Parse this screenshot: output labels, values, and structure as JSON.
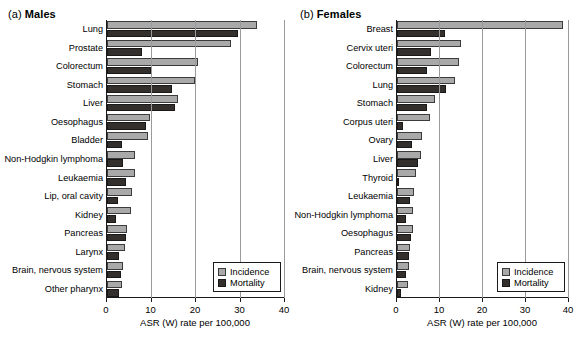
{
  "figure": {
    "axis_label": "ASR (W) rate per 100,000",
    "legend": {
      "incidence": "Incidence",
      "mortality": "Mortality"
    },
    "colors": {
      "incidence": "#a9a9a9",
      "mortality": "#332f2d",
      "axis": "#1a1a1a",
      "grid": "#9a9a9a"
    },
    "ticks": [
      "0",
      "10",
      "20",
      "30",
      "40"
    ]
  },
  "chart_data": [
    {
      "type": "bar",
      "orientation": "horizontal",
      "panel_tag": "(a)",
      "title": "Males",
      "xlabel": "ASR (W) rate per 100,000",
      "ylabel": "",
      "xlim": [
        0,
        40
      ],
      "xticks": [
        0,
        10,
        20,
        30,
        40
      ],
      "grid": true,
      "legend_position": "bottom-right",
      "categories": [
        "Lung",
        "Prostate",
        "Colorectum",
        "Stomach",
        "Liver",
        "Oesophagus",
        "Bladder",
        "Non-Hodgkin lymphoma",
        "Leukaemia",
        "Lip, oral cavity",
        "Kidney",
        "Pancreas",
        "Larynx",
        "Brain, nervous system",
        "Other pharynx"
      ],
      "series": [
        {
          "name": "Incidence",
          "values": [
            33.8,
            27.9,
            20.4,
            19.8,
            16.0,
            9.7,
            9.2,
            6.4,
            6.3,
            5.6,
            5.4,
            4.5,
            4.0,
            3.7,
            3.4
          ]
        },
        {
          "name": "Mortality",
          "values": [
            29.4,
            7.9,
            9.9,
            14.7,
            15.2,
            8.8,
            3.4,
            3.7,
            4.2,
            2.5,
            2.1,
            4.3,
            2.6,
            3.1,
            2.8
          ]
        }
      ]
    },
    {
      "type": "bar",
      "orientation": "horizontal",
      "panel_tag": "(b)",
      "title": "Females",
      "xlabel": "ASR (W) rate per 100,000",
      "ylabel": "",
      "xlim": [
        0,
        40
      ],
      "xticks": [
        0,
        10,
        20,
        30,
        40
      ],
      "grid": true,
      "legend_position": "bottom-right",
      "categories": [
        "Breast",
        "Cervix uteri",
        "Colorectum",
        "Lung",
        "Stomach",
        "Corpus uteri",
        "Ovary",
        "Liver",
        "Thyroid",
        "Leukaemia",
        "Non-Hodgkin lymphoma",
        "Oesophagus",
        "Pancreas",
        "Brain, nervous system",
        "Kidney"
      ],
      "series": [
        {
          "name": "Incidence",
          "values": [
            38.6,
            14.9,
            14.4,
            13.5,
            8.8,
            7.7,
            5.8,
            5.5,
            4.4,
            4.0,
            3.8,
            3.7,
            3.0,
            2.7,
            2.6
          ]
        },
        {
          "name": "Mortality",
          "values": [
            11.2,
            7.9,
            7.0,
            11.4,
            7.0,
            1.4,
            3.5,
            4.9,
            0.4,
            3.0,
            2.1,
            3.3,
            2.9,
            2.2,
            1.0
          ]
        }
      ]
    }
  ]
}
